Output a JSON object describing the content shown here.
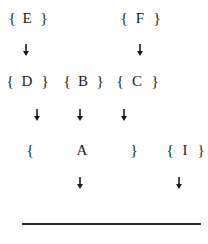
{
  "diagram": {
    "row1": {
      "E": {
        "open": "{",
        "label": "E",
        "close": "}"
      },
      "F": {
        "open": "{",
        "label": "F",
        "close": "}"
      }
    },
    "row2": {
      "D": {
        "open": "{",
        "label": "D",
        "close": "}"
      },
      "B": {
        "open": "{",
        "label": "B",
        "close": "}"
      },
      "C": {
        "open": "{",
        "label": "C",
        "close": "}"
      }
    },
    "row3": {
      "A": {
        "open": "{",
        "label": "A",
        "close": "}"
      },
      "I": {
        "open": "{",
        "label": "I",
        "close": "}"
      }
    },
    "arrow_icon": "down-arrow-icon",
    "colors": {
      "text": "#1a1a1a",
      "rule": "#2a2a2a",
      "background": "#ffffff"
    }
  }
}
